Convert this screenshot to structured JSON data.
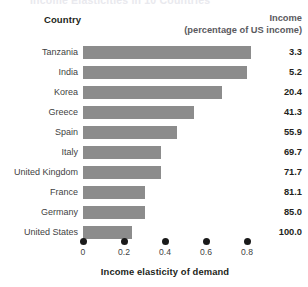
{
  "figure": {
    "title_cropped": "Income Elasticities in 10 Countries"
  },
  "headers": {
    "country": "Country",
    "income_line1": "Income",
    "income_line2": "(percentage of US income)"
  },
  "axis": {
    "title": "Income elasticity of demand",
    "ticks": [
      "0",
      "0.2",
      "0.4",
      "0.6",
      "0.8"
    ]
  },
  "chart_data": {
    "type": "bar",
    "orientation": "horizontal",
    "title": "Income Elasticities in 10 Countries",
    "xlabel": "Income elasticity of demand",
    "ylabel": "Country",
    "xlim": [
      0,
      0.9
    ],
    "xticks": [
      0,
      0.2,
      0.4,
      0.6,
      0.8
    ],
    "xticklabels": [
      "0",
      "0.2",
      "0.4",
      "0.6",
      "0.8"
    ],
    "grid": false,
    "legend": false,
    "bar_color": "#8c8c8c",
    "categories": [
      "Tanzania",
      "India",
      "Korea",
      "Greece",
      "Spain",
      "Italy",
      "United Kingdom",
      "France",
      "Germany",
      "United States"
    ],
    "values": [
      0.82,
      0.8,
      0.68,
      0.54,
      0.46,
      0.38,
      0.38,
      0.3,
      0.3,
      0.24
    ],
    "annotation_column": {
      "header": "Income (percentage of US income)",
      "values": [
        "3.3",
        "5.2",
        "20.4",
        "41.3",
        "55.9",
        "69.7",
        "71.7",
        "81.1",
        "85.0",
        "100.0"
      ]
    },
    "rows": [
      {
        "country": "Tanzania",
        "elasticity": 0.82,
        "income": "3.3"
      },
      {
        "country": "India",
        "elasticity": 0.8,
        "income": "5.2"
      },
      {
        "country": "Korea",
        "elasticity": 0.68,
        "income": "20.4"
      },
      {
        "country": "Greece",
        "elasticity": 0.54,
        "income": "41.3"
      },
      {
        "country": "Spain",
        "elasticity": 0.46,
        "income": "55.9"
      },
      {
        "country": "Italy",
        "elasticity": 0.38,
        "income": "69.7"
      },
      {
        "country": "United Kingdom",
        "elasticity": 0.38,
        "income": "71.7"
      },
      {
        "country": "France",
        "elasticity": 0.3,
        "income": "81.1"
      },
      {
        "country": "Germany",
        "elasticity": 0.3,
        "income": "85.0"
      },
      {
        "country": "United States",
        "elasticity": 0.24,
        "income": "100.0"
      }
    ]
  }
}
